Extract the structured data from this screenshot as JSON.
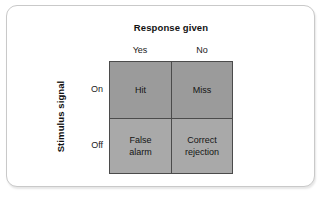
{
  "figure": {
    "type": "signal-detection-matrix",
    "column_axis": {
      "title": "Response given",
      "ticks": [
        "Yes",
        "No"
      ]
    },
    "row_axis": {
      "title": "Stimulus signal",
      "ticks": [
        "On",
        "Off"
      ]
    },
    "cells": [
      {
        "name": "hit",
        "label": "Hit",
        "row": "On",
        "column": "Yes",
        "fill": "#9b9b9b"
      },
      {
        "name": "miss",
        "label": "Miss",
        "row": "On",
        "column": "No",
        "fill": "#9b9b9b"
      },
      {
        "name": "false-alarm",
        "label": "False\nalarm",
        "row": "Off",
        "column": "Yes",
        "fill": "#a9a9a9"
      },
      {
        "name": "correct-rejection",
        "label": "Correct\nrejection",
        "row": "Off",
        "column": "No",
        "fill": "#a9a9a9"
      }
    ],
    "colors": {
      "card_background": "#ffffff",
      "card_border": "#c9c9c9",
      "grid_line": "#4b4b4b",
      "text": "#141414"
    }
  }
}
